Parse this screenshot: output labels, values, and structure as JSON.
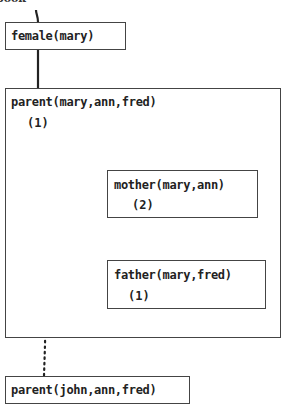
{
  "header_fragment": "book",
  "nodes": {
    "female": {
      "label": "female(mary)"
    },
    "parent_outer": {
      "label": "parent(mary,ann,fred)",
      "clause": "(1)"
    },
    "mother": {
      "label": "mother(mary,ann)",
      "clause": "(2)"
    },
    "father": {
      "label": "father(mary,fred)",
      "clause": "(1)"
    },
    "parent_next": {
      "label": "parent(john,ann,fred)"
    }
  },
  "colors": {
    "line": "#222222",
    "border": "#444444"
  }
}
